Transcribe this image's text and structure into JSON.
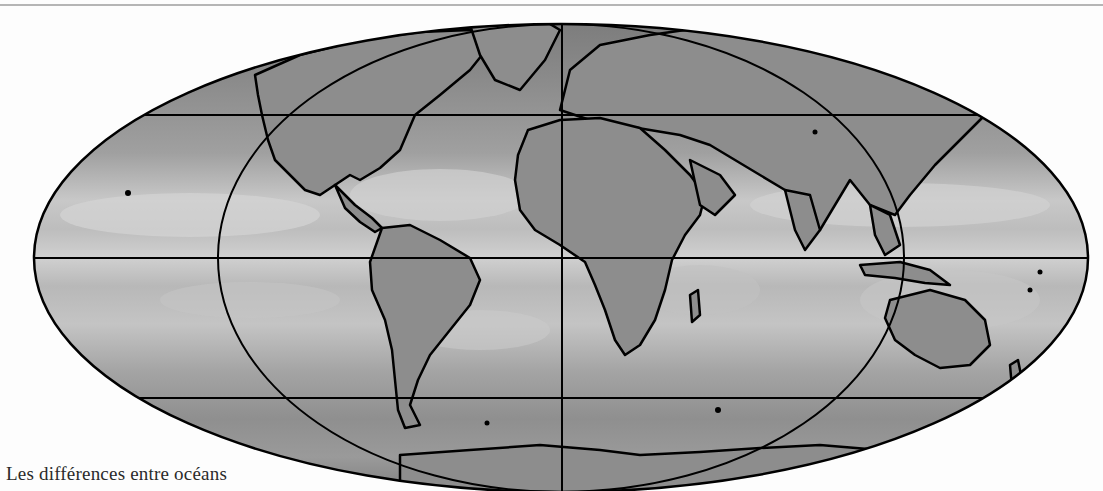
{
  "figure": {
    "type": "world-map",
    "projection": "Mollweide",
    "rendering": "grayscale ocean field with black coastline outlines",
    "caption": "Les différences entre océans"
  },
  "map": {
    "graticule": {
      "latitude_lines": 3,
      "central_meridian": true,
      "meridian_ellipse": true
    },
    "colors": {
      "background": "#fdfdfd",
      "ocean_dark": "#7a7a7a",
      "ocean_mid": "#9c9c9c",
      "ocean_light": "#c9c9c9",
      "land": "#8e8e8e",
      "outline": "#000000",
      "top_rule": "#b5b5b5"
    }
  }
}
